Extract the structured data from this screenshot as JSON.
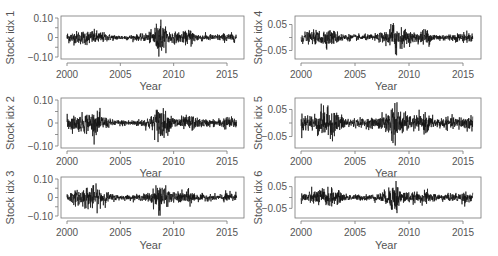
{
  "chart_data": [
    {
      "type": "line",
      "panel": "top-left",
      "title": "",
      "xlabel": "Year",
      "ylabel": "Stock idx 1",
      "xlim": [
        2000,
        2016
      ],
      "ylim": [
        -0.1,
        0.1
      ],
      "xticks": [
        "2000",
        "2005",
        "2010",
        "2015"
      ],
      "yticks": [
        "-0.10",
        "0",
        "0.10"
      ],
      "grid": false,
      "description": "Daily returns; volatility clusters around 2000-2003, large spike at 2008-2009 reaching ~+0.10/-0.09, smaller clusters 2011-2012",
      "volatility_profile": {
        "years": [
          2000,
          2001,
          2002,
          2003,
          2004,
          2005,
          2006,
          2007,
          2008,
          2008.8,
          2009,
          2010,
          2011,
          2011.7,
          2012,
          2013,
          2014,
          2015,
          2016
        ],
        "amplitude": [
          0.025,
          0.03,
          0.035,
          0.03,
          0.015,
          0.012,
          0.012,
          0.015,
          0.03,
          0.1,
          0.05,
          0.025,
          0.025,
          0.045,
          0.02,
          0.015,
          0.015,
          0.02,
          0.02
        ]
      }
    },
    {
      "type": "line",
      "panel": "middle-left",
      "xlabel": "Year",
      "ylabel": "Stock idx 2",
      "xlim": [
        2000,
        2016
      ],
      "ylim": [
        -0.1,
        0.1
      ],
      "xticks": [
        "2000",
        "2005",
        "2010",
        "2015"
      ],
      "yticks": [
        "-0.10",
        "0",
        "0.10"
      ],
      "grid": false,
      "volatility_profile": {
        "years": [
          2000,
          2001,
          2002,
          2003,
          2004,
          2005,
          2006,
          2007,
          2008,
          2008.8,
          2009,
          2010,
          2011,
          2011.7,
          2012,
          2013,
          2014,
          2015,
          2016
        ],
        "amplitude": [
          0.03,
          0.03,
          0.045,
          0.04,
          0.015,
          0.012,
          0.012,
          0.015,
          0.03,
          0.09,
          0.05,
          0.025,
          0.025,
          0.035,
          0.02,
          0.015,
          0.015,
          0.025,
          0.02
        ]
      }
    },
    {
      "type": "line",
      "panel": "bottom-left",
      "xlabel": "Year",
      "ylabel": "Stock idx 3",
      "xlim": [
        2000,
        2016
      ],
      "ylim": [
        -0.1,
        0.1
      ],
      "xticks": [
        "2000",
        "2005",
        "2010",
        "2015"
      ],
      "yticks": [
        "-0.10",
        "0",
        "0.10"
      ],
      "grid": false,
      "volatility_profile": {
        "years": [
          2000,
          2001,
          2002,
          2003,
          2004,
          2005,
          2006,
          2007,
          2008,
          2008.8,
          2009,
          2010,
          2011,
          2011.7,
          2012,
          2013,
          2014,
          2015,
          2016
        ],
        "amplitude": [
          0.03,
          0.035,
          0.06,
          0.05,
          0.02,
          0.012,
          0.012,
          0.015,
          0.03,
          0.1,
          0.05,
          0.025,
          0.03,
          0.04,
          0.02,
          0.015,
          0.015,
          0.025,
          0.025
        ]
      }
    },
    {
      "type": "line",
      "panel": "top-right",
      "xlabel": "Year",
      "ylabel": "Stock idx 4",
      "xlim": [
        2000,
        2016
      ],
      "ylim": [
        -0.075,
        0.075
      ],
      "xticks": [
        "2000",
        "2005",
        "2010",
        "2015"
      ],
      "yticks": [
        "-0.05",
        "0.05"
      ],
      "grid": false,
      "volatility_profile": {
        "years": [
          2000,
          2001,
          2002,
          2003,
          2004,
          2005,
          2006,
          2007,
          2008,
          2008.8,
          2009,
          2010,
          2011,
          2011.7,
          2012,
          2013,
          2014,
          2015,
          2016
        ],
        "amplitude": [
          0.02,
          0.02,
          0.03,
          0.025,
          0.012,
          0.01,
          0.01,
          0.012,
          0.025,
          0.075,
          0.04,
          0.02,
          0.02,
          0.035,
          0.015,
          0.012,
          0.012,
          0.018,
          0.015
        ]
      }
    },
    {
      "type": "line",
      "panel": "middle-right",
      "xlabel": "Year",
      "ylabel": "Stock idx 5",
      "xlim": [
        2000,
        2016
      ],
      "ylim": [
        -0.085,
        0.085
      ],
      "xticks": [
        "2000",
        "2005",
        "2010",
        "2015"
      ],
      "yticks": [
        "-0.05",
        "0.05"
      ],
      "grid": false,
      "volatility_profile": {
        "years": [
          2000,
          2001,
          2002,
          2003,
          2004,
          2005,
          2006,
          2007,
          2008,
          2008.8,
          2009,
          2010,
          2011,
          2011.7,
          2012,
          2013,
          2014,
          2015,
          2016
        ],
        "amplitude": [
          0.03,
          0.03,
          0.05,
          0.045,
          0.02,
          0.015,
          0.015,
          0.018,
          0.035,
          0.085,
          0.045,
          0.025,
          0.025,
          0.035,
          0.02,
          0.018,
          0.018,
          0.025,
          0.025
        ]
      }
    },
    {
      "type": "line",
      "panel": "bottom-right",
      "xlabel": "Year",
      "ylabel": "Stock idx 6",
      "xlim": [
        2000,
        2016
      ],
      "ylim": [
        -0.085,
        0.085
      ],
      "xticks": [
        "2000",
        "2005",
        "2010",
        "2015"
      ],
      "yticks": [
        "-0.05",
        "0.05"
      ],
      "grid": false,
      "volatility_profile": {
        "years": [
          2000,
          2001,
          2002,
          2003,
          2004,
          2005,
          2006,
          2007,
          2008,
          2008.8,
          2009,
          2010,
          2011,
          2011.7,
          2012,
          2013,
          2014,
          2015,
          2016
        ],
        "amplitude": [
          0.025,
          0.025,
          0.04,
          0.035,
          0.015,
          0.012,
          0.012,
          0.015,
          0.03,
          0.085,
          0.04,
          0.02,
          0.02,
          0.03,
          0.018,
          0.015,
          0.015,
          0.025,
          0.02
        ]
      }
    }
  ],
  "panels": [
    {
      "ylabel": "Stock idx 1",
      "xlabel": "Year",
      "yticks": [
        "0.10",
        "0",
        "−0.10"
      ]
    },
    {
      "ylabel": "Stock idx 2",
      "xlabel": "Year",
      "yticks": [
        "0.10",
        "0",
        "−0.10"
      ]
    },
    {
      "ylabel": "Stock idx 3",
      "xlabel": "Year",
      "yticks": [
        "0.10",
        "0",
        "−0.10"
      ]
    },
    {
      "ylabel": "Stock idx 4",
      "xlabel": "Year",
      "yticks": [
        "0.05",
        "−0.05"
      ]
    },
    {
      "ylabel": "Stock idx 5",
      "xlabel": "Year",
      "yticks": [
        "0.05",
        "−0.05"
      ]
    },
    {
      "ylabel": "Stock idx 6",
      "xlabel": "Year",
      "yticks": [
        "0.05",
        "−0.05"
      ]
    }
  ],
  "xticks": [
    "2000",
    "2005",
    "2010",
    "2015"
  ],
  "colors": {
    "series": "#111111",
    "axis": "#777777",
    "text": "#555555"
  }
}
